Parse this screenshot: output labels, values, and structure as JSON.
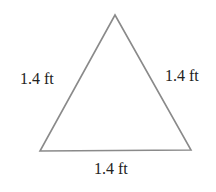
{
  "diagram": {
    "shape": "equilateral triangle",
    "stroke_color": "#8a8a8a",
    "vertices": {
      "top": [
        115,
        15
      ],
      "bottom_left": [
        40,
        151
      ],
      "bottom_right": [
        191,
        150
      ]
    },
    "labels": {
      "left_side": "1.4 ft",
      "right_side": "1.4 ft",
      "bottom_side": "1.4 ft"
    }
  }
}
